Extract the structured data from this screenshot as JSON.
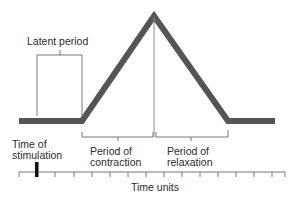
{
  "diagram": {
    "labels": {
      "latent_period": "Latent period",
      "time_of_stimulation_line1": "Time of",
      "time_of_stimulation_line2": "stimulation",
      "contraction_line1": "Period of",
      "contraction_line2": "contraction",
      "relaxation_line1": "Period of",
      "relaxation_line2": "relaxation",
      "x_axis": "Time units"
    },
    "colors": {
      "curve": "#555555",
      "lines": "#777777",
      "stimulus_mark": "#111111",
      "text": "#2b2b2b"
    },
    "axis": {
      "tick_count": 15,
      "stimulation_tick_index": 1
    }
  }
}
